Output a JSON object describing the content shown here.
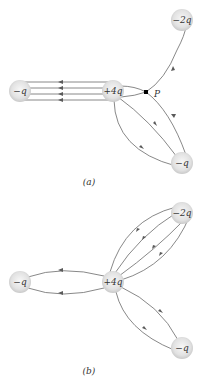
{
  "colors": {
    "line": "#6a6a6a",
    "arrow": "#5a5a5a",
    "charge_fill_center": "#f4f4f4",
    "charge_fill_edge": "#c8c8c8",
    "point": "#000000",
    "text": "#333333"
  },
  "panel_a": {
    "label": "(a)",
    "charges": [
      {
        "id": "left",
        "label": "−q",
        "x": 20,
        "y": 91
      },
      {
        "id": "center",
        "label": "+4q",
        "x": 113,
        "y": 91
      },
      {
        "id": "top-right",
        "label": "−2q",
        "x": 182,
        "y": 20
      },
      {
        "id": "bottom-right",
        "label": "−q",
        "x": 182,
        "y": 163
      }
    ],
    "point": {
      "label": "P",
      "x": 146,
      "y": 92
    }
  },
  "panel_b": {
    "label": "(b)",
    "charges": [
      {
        "id": "left",
        "label": "−q",
        "x": 20,
        "y": 282
      },
      {
        "id": "center",
        "label": "+4q",
        "x": 113,
        "y": 282
      },
      {
        "id": "top-right",
        "label": "−2q",
        "x": 182,
        "y": 213
      },
      {
        "id": "bottom-right",
        "label": "−q",
        "x": 182,
        "y": 348
      }
    ]
  }
}
